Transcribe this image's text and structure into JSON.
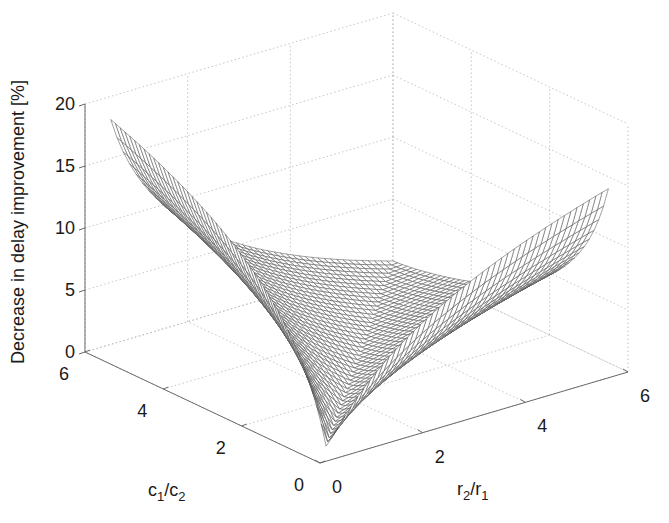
{
  "chart_data": {
    "type": "surface",
    "title": "",
    "xlabel": "r2/r1",
    "ylabel": "c1/c2",
    "zlabel": "Decrease in delay improvement [%]",
    "xlabel_parts": {
      "base1": "r",
      "sub1": "2",
      "sep": "/",
      "base2": "r",
      "sub2": "1"
    },
    "ylabel_parts": {
      "base1": "c",
      "sub1": "1",
      "sep": "/",
      "base2": "c",
      "sub2": "2"
    },
    "xlim": [
      0,
      6
    ],
    "ylim": [
      0,
      6
    ],
    "zlim": [
      0,
      20
    ],
    "x_ticks": [
      "0",
      "2",
      "4",
      "6"
    ],
    "y_ticks": [
      "0",
      "2",
      "4",
      "6"
    ],
    "z_ticks": [
      "0",
      "5",
      "10",
      "15",
      "20"
    ],
    "grid": true,
    "x": [
      0.5,
      1,
      2,
      3,
      4,
      5,
      6
    ],
    "y": [
      0.5,
      1,
      2,
      3,
      4,
      5,
      6
    ],
    "z": [
      [
        0.0,
        2.7,
        6.6,
        9.2,
        11.1,
        12.7,
        14.0
      ],
      [
        5.1,
        0.0,
        2.7,
        4.9,
        6.6,
        8.0,
        9.2
      ],
      [
        10.1,
        5.1,
        0.0,
        1.3,
        2.7,
        3.8,
        4.9
      ],
      [
        13.1,
        8.0,
        3.0,
        0.0,
        0.8,
        1.8,
        2.7
      ],
      [
        15.2,
        10.1,
        5.1,
        2.1,
        0.0,
        0.6,
        1.3
      ],
      [
        16.8,
        11.7,
        6.7,
        3.7,
        1.6,
        0.0,
        0.5
      ],
      [
        18.1,
        13.1,
        8.0,
        5.1,
        3.0,
        1.3,
        0.0
      ]
    ],
    "z_note": "rows indexed by c1/c2 (y), columns by r2/r1 (x); values estimated from rendered surface",
    "model": {
      "x_min": 0.5,
      "x_max": 6,
      "y_min": 0.5,
      "y_max": 6,
      "n": 45,
      "slope_pos": 7.3,
      "slope_neg": 4.3,
      "exp_neg": 1.3
    },
    "colors": {
      "mesh_edge": "#555555",
      "face": "#ffffff",
      "axis": "#6a6a6a",
      "grid": "#b8b8b8",
      "text": "#1a1a1a"
    }
  }
}
